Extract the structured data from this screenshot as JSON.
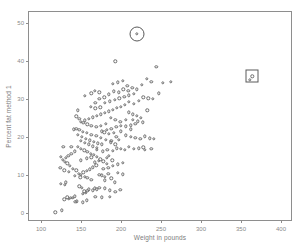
{
  "chart_data": {
    "type": "scatter",
    "title": "",
    "xlabel": "Weight in pounds",
    "ylabel": "Percent fat method 1",
    "xlim": [
      85,
      415
    ],
    "ylim": [
      -2.5,
      53
    ],
    "xticks": [
      100,
      150,
      200,
      250,
      300,
      350,
      400
    ],
    "yticks": [
      0,
      10,
      20,
      30,
      40,
      50
    ],
    "grid": false,
    "legend": null,
    "marker": "open-circle",
    "marker_color": "#6d6d6d",
    "frame_color": "#8e8e8e",
    "label_color": "#8a8a8a",
    "annotations": [
      {
        "shape": "circle",
        "x": 220,
        "y": 47.2,
        "note": "circled outlier"
      },
      {
        "shape": "square",
        "x": 364,
        "y": 36.0,
        "note": "boxed outlier"
      }
    ],
    "points": [
      [
        118,
        0.1
      ],
      [
        126,
        0.6
      ],
      [
        125,
        7.6
      ],
      [
        130,
        7.3
      ],
      [
        131,
        8.0
      ],
      [
        133,
        4.0
      ],
      [
        137,
        3.9
      ],
      [
        140,
        3.9
      ],
      [
        142,
        4.3
      ],
      [
        145,
        3.0
      ],
      [
        152,
        5.0
      ],
      [
        154,
        5.6
      ],
      [
        156,
        5.2
      ],
      [
        158,
        5.8
      ],
      [
        160,
        6.1
      ],
      [
        151,
        6.5
      ],
      [
        148,
        6.9
      ],
      [
        165,
        5.9
      ],
      [
        167,
        6.4
      ],
      [
        170,
        6.1
      ],
      [
        173,
        6.6
      ],
      [
        176,
        4.0
      ],
      [
        180,
        8.5
      ],
      [
        163,
        8.6
      ],
      [
        158,
        9.1
      ],
      [
        155,
        9.5
      ],
      [
        150,
        9.9
      ],
      [
        147,
        10.3
      ],
      [
        144,
        11.2
      ],
      [
        140,
        11.6
      ],
      [
        136,
        12.4
      ],
      [
        133,
        13.0
      ],
      [
        130,
        13.4
      ],
      [
        127,
        14.0
      ],
      [
        125,
        14.7
      ],
      [
        124,
        11.8
      ],
      [
        129,
        11.2
      ],
      [
        135,
        10.8
      ],
      [
        142,
        9.7
      ],
      [
        149,
        9.3
      ],
      [
        153,
        10.6
      ],
      [
        157,
        11.0
      ],
      [
        161,
        11.4
      ],
      [
        165,
        12.0
      ],
      [
        169,
        12.5
      ],
      [
        173,
        10.0
      ],
      [
        176,
        9.8
      ],
      [
        180,
        9.5
      ],
      [
        184,
        10.2
      ],
      [
        188,
        9.0
      ],
      [
        182,
        12.9
      ],
      [
        178,
        13.5
      ],
      [
        174,
        14.1
      ],
      [
        170,
        14.8
      ],
      [
        166,
        15.2
      ],
      [
        162,
        15.6
      ],
      [
        158,
        16.0
      ],
      [
        154,
        16.4
      ],
      [
        150,
        16.9
      ],
      [
        146,
        17.3
      ],
      [
        142,
        16.2
      ],
      [
        138,
        15.6
      ],
      [
        134,
        15.0
      ],
      [
        131,
        14.4
      ],
      [
        128,
        17.4
      ],
      [
        185,
        15.0
      ],
      [
        190,
        16.3
      ],
      [
        195,
        17.0
      ],
      [
        200,
        16.8
      ],
      [
        205,
        16.5
      ],
      [
        193,
        18.0
      ],
      [
        187,
        18.6
      ],
      [
        181,
        19.2
      ],
      [
        175,
        19.8
      ],
      [
        169,
        20.2
      ],
      [
        163,
        20.6
      ],
      [
        157,
        21.0
      ],
      [
        152,
        21.4
      ],
      [
        148,
        21.8
      ],
      [
        144,
        22.2
      ],
      [
        150,
        19.0
      ],
      [
        155,
        18.5
      ],
      [
        160,
        18.0
      ],
      [
        165,
        17.5
      ],
      [
        170,
        17.1
      ],
      [
        176,
        21.5
      ],
      [
        182,
        21.8
      ],
      [
        188,
        22.2
      ],
      [
        194,
        22.6
      ],
      [
        200,
        23.0
      ],
      [
        206,
        20.4
      ],
      [
        212,
        20.0
      ],
      [
        218,
        19.7
      ],
      [
        224,
        19.5
      ],
      [
        230,
        20.1
      ],
      [
        236,
        19.6
      ],
      [
        228,
        17.2
      ],
      [
        222,
        17.0
      ],
      [
        216,
        16.9
      ],
      [
        210,
        17.3
      ],
      [
        192,
        8.0
      ],
      [
        186,
        4.1
      ],
      [
        150,
        24.0
      ],
      [
        155,
        24.4
      ],
      [
        160,
        24.8
      ],
      [
        165,
        25.2
      ],
      [
        170,
        25.6
      ],
      [
        175,
        26.0
      ],
      [
        180,
        26.4
      ],
      [
        185,
        26.8
      ],
      [
        190,
        27.2
      ],
      [
        195,
        27.6
      ],
      [
        200,
        28.0
      ],
      [
        205,
        28.4
      ],
      [
        210,
        26.5
      ],
      [
        215,
        26.0
      ],
      [
        220,
        25.5
      ],
      [
        225,
        25.0
      ],
      [
        218,
        23.5
      ],
      [
        212,
        23.1
      ],
      [
        206,
        22.8
      ],
      [
        199,
        24.0
      ],
      [
        193,
        24.5
      ],
      [
        187,
        25.0
      ],
      [
        181,
        23.4
      ],
      [
        175,
        23.0
      ],
      [
        169,
        22.6
      ],
      [
        163,
        22.9
      ],
      [
        158,
        23.3
      ],
      [
        153,
        23.7
      ],
      [
        148,
        24.8
      ],
      [
        144,
        25.4
      ],
      [
        141,
        22.0
      ],
      [
        146,
        20.5
      ],
      [
        151,
        20.0
      ],
      [
        156,
        19.5
      ],
      [
        161,
        19.1
      ],
      [
        166,
        18.7
      ],
      [
        171,
        18.3
      ],
      [
        167,
        13.3
      ],
      [
        172,
        13.7
      ],
      [
        177,
        16.2
      ],
      [
        183,
        16.6
      ],
      [
        189,
        13.8
      ],
      [
        178,
        11.5
      ],
      [
        184,
        11.9
      ],
      [
        190,
        12.3
      ],
      [
        196,
        12.7
      ],
      [
        202,
        13.2
      ],
      [
        196,
        10.5
      ],
      [
        202,
        10.1
      ],
      [
        180,
        29.0
      ],
      [
        186,
        29.4
      ],
      [
        192,
        29.8
      ],
      [
        198,
        30.2
      ],
      [
        204,
        30.6
      ],
      [
        210,
        31.0
      ],
      [
        216,
        31.4
      ],
      [
        209,
        32.2
      ],
      [
        203,
        32.6
      ],
      [
        197,
        31.8
      ],
      [
        191,
        32.0
      ],
      [
        185,
        31.2
      ],
      [
        179,
        30.5
      ],
      [
        173,
        30.0
      ],
      [
        168,
        29.0
      ],
      [
        173,
        31.8
      ],
      [
        167,
        32.2
      ],
      [
        162,
        28.0
      ],
      [
        168,
        27.5
      ],
      [
        174,
        27.8
      ],
      [
        190,
        34.0
      ],
      [
        196,
        34.4
      ],
      [
        202,
        34.8
      ],
      [
        208,
        33.5
      ],
      [
        214,
        33.0
      ],
      [
        220,
        32.6
      ],
      [
        226,
        33.8
      ],
      [
        232,
        35.4
      ],
      [
        238,
        34.5
      ],
      [
        228,
        30.5
      ],
      [
        234,
        30.2
      ],
      [
        222,
        29.5
      ],
      [
        216,
        28.8
      ],
      [
        210,
        29.2
      ],
      [
        215,
        24.5
      ],
      [
        221,
        24.1
      ],
      [
        227,
        23.8
      ],
      [
        233,
        27.0
      ],
      [
        240,
        30.0
      ],
      [
        247,
        31.5
      ],
      [
        244,
        38.5
      ],
      [
        262,
        34.5
      ],
      [
        252,
        34.3
      ],
      [
        241,
        19.5
      ],
      [
        238,
        16.9
      ],
      [
        230,
        16.6
      ],
      [
        193,
        40.0
      ],
      [
        163,
        31.5
      ],
      [
        155,
        30.8
      ],
      [
        146,
        27.0
      ],
      [
        138,
        17.3
      ],
      [
        129,
        3.5
      ],
      [
        135,
        3.6
      ],
      [
        143,
        2.8
      ],
      [
        157,
        3.2
      ],
      [
        152,
        2.7
      ],
      [
        168,
        4.2
      ],
      [
        180,
        6.4
      ],
      [
        186,
        5.9
      ],
      [
        193,
        5.5
      ],
      [
        199,
        6.0
      ],
      [
        157,
        14.3
      ],
      [
        150,
        13.8
      ],
      [
        163,
        14.6
      ],
      [
        170,
        16.5
      ],
      [
        176,
        18.0
      ],
      [
        182,
        14.5
      ],
      [
        188,
        19.0
      ],
      [
        194,
        20.0
      ],
      [
        200,
        21.5
      ],
      [
        206,
        24.5
      ],
      [
        212,
        22.0
      ],
      [
        197,
        19.3
      ],
      [
        191,
        21.0
      ],
      [
        185,
        20.8
      ],
      [
        179,
        21.2
      ],
      [
        220,
        47.2
      ],
      [
        364,
        36.0
      ],
      [
        361,
        35.1
      ]
    ]
  }
}
